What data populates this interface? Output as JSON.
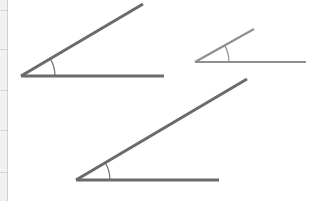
{
  "diagram": {
    "title": "Angles of different line lengths",
    "edge_ticks": [
      10,
      49,
      90,
      130,
      172
    ],
    "angles": [
      {
        "label": "Angle A",
        "vertex": [
          21,
          76
        ],
        "ray_end": [
          143,
          4
        ],
        "base_end": [
          164,
          76
        ],
        "arc_radius": 34,
        "color": "#6b6b6b",
        "stroke_width": 3
      },
      {
        "label": "Angle B",
        "vertex": [
          195,
          62
        ],
        "ray_end": [
          254,
          29
        ],
        "base_end": [
          306,
          62
        ],
        "arc_radius": 34,
        "color": "#8f8f8f",
        "stroke_width": 2.2
      },
      {
        "label": "Angle C",
        "vertex": [
          76,
          180
        ],
        "ray_end": [
          247,
          79
        ],
        "base_end": [
          219,
          180
        ],
        "arc_radius": 34,
        "color": "#6b6b6b",
        "stroke_width": 3
      }
    ]
  }
}
